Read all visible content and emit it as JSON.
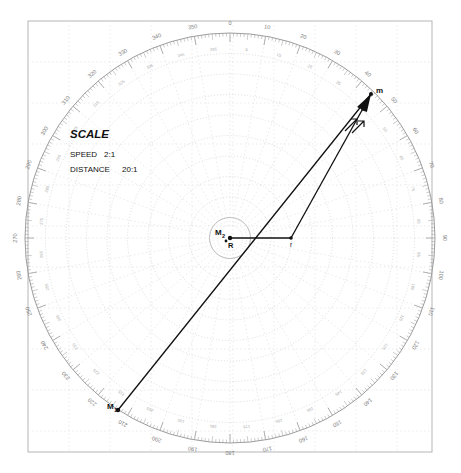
{
  "sheet": {
    "name": "maneuvering-board-plotting-sheet",
    "background": "#ffffff",
    "frame_color": "#b9b9b9",
    "grid_color": "#d9d9d9",
    "polar_color": "#c9c9c9",
    "vector_color": "#1a1a1a"
  },
  "legend": {
    "title": "SCALE",
    "speed_label": "SPEED",
    "speed_value": "2:1",
    "distance_label": "DISTANCE",
    "distance_value": "20:1"
  },
  "points": {
    "own_ship": "R",
    "relative_start": "M",
    "relative_start_sub": "1",
    "own_ship_mark": "M",
    "own_ship_mark_sub": "2",
    "apex": "m",
    "vertex": "r"
  },
  "compass": {
    "major_labels": [
      "0",
      "10",
      "20",
      "30",
      "40",
      "50",
      "60",
      "70",
      "80",
      "90",
      "100",
      "110",
      "120",
      "130",
      "140",
      "150",
      "160",
      "170",
      "180",
      "190",
      "200",
      "210",
      "220",
      "230",
      "240",
      "250",
      "260",
      "270",
      "280",
      "290",
      "300",
      "310",
      "320",
      "330",
      "340",
      "350"
    ],
    "minor_labels": [
      "5",
      "15",
      "25",
      "35",
      "45",
      "55",
      "65",
      "75",
      "85",
      "95",
      "105",
      "115",
      "125",
      "135",
      "145",
      "155",
      "165",
      "175",
      "185",
      "195",
      "205",
      "215",
      "225",
      "235",
      "245",
      "255",
      "265",
      "275",
      "285",
      "295",
      "305",
      "315",
      "325",
      "335",
      "345",
      "355"
    ],
    "tick_interval_deg": 1,
    "major_interval_deg": 10,
    "north_label": "0",
    "east_label": "90",
    "south_label": "180",
    "west_label": "270"
  },
  "chart_data": {
    "type": "scatter",
    "center": {
      "x": 230,
      "y": 238
    },
    "outer_radius": 205,
    "ring_count": 10,
    "vectors": [
      {
        "name": "relative-motion-line",
        "from": "M1",
        "to": "m",
        "x1": 118,
        "y1": 410,
        "x2": 371,
        "y2": 94,
        "arrow": true
      },
      {
        "name": "own-ship-vector",
        "from": "R",
        "to": "r",
        "x1": 230,
        "y1": 238,
        "x2": 291,
        "y2": 238,
        "arrow": false
      },
      {
        "name": "true-motion-vector",
        "from": "r",
        "to": "m",
        "x1": 291,
        "y1": 238,
        "x2": 371,
        "y2": 94,
        "arrow": true
      }
    ],
    "xlabel": "",
    "ylabel": "",
    "grid": true,
    "legend_position": "upper-left"
  }
}
